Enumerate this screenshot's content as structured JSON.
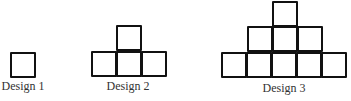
{
  "figure": {
    "stroke_color": "#111111",
    "label_color": "#333333",
    "cell_size": 25,
    "designs": [
      {
        "label": "Design 1",
        "label_x": 23,
        "label_y": 80,
        "rows": [
          {
            "count": 1,
            "x": 10,
            "y": 52
          }
        ]
      },
      {
        "label": "Design 2",
        "label_x": 128,
        "label_y": 80,
        "rows": [
          {
            "count": 1,
            "x": 116,
            "y": 25
          },
          {
            "count": 3,
            "x": 91,
            "y": 51
          }
        ]
      },
      {
        "label": "Design 3",
        "label_x": 284,
        "label_y": 82,
        "rows": [
          {
            "count": 1,
            "x": 272,
            "y": 1
          },
          {
            "count": 3,
            "x": 247,
            "y": 26
          },
          {
            "count": 5,
            "x": 221,
            "y": 52
          }
        ]
      }
    ]
  }
}
